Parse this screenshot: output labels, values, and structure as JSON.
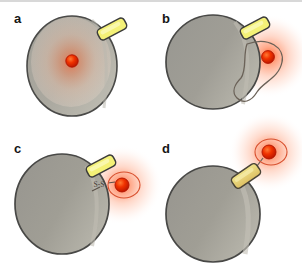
{
  "figure": {
    "kind": "scientific-schematic",
    "background_color": "#ffffff",
    "top_rule_color": "#d8d8d8",
    "panel_count": 4
  },
  "palette": {
    "cell_fill": "#9c9a92",
    "cell_fill_light": "#b4b2a9",
    "cell_outline": "#4a4a48",
    "cell_highlight": "#c9c7bd",
    "tag_fill": "#f2ef7a",
    "tag_fill_deep": "#e8c96a",
    "tag_outline": "#3c3c3a",
    "fluorophore_core": "#ee2200",
    "fluorophore_rim": "#c21a00",
    "glow_color": "#ff4d1a",
    "vesicle_outline": "#6b6258",
    "label_color": "#151515",
    "panel_a_interior": "#f0ddd2"
  },
  "panels": [
    {
      "id": "a",
      "label": "a",
      "description": "Intact cell with membrane tag and intracellular fluorophore, diffuse internal glow",
      "cell": {
        "cx": 72,
        "cy": 66,
        "rx": 45,
        "ry": 50,
        "has_interior_glow": true
      },
      "tag": {
        "cx": 112,
        "cy": 29,
        "width": 30,
        "height": 12,
        "rotation": -28,
        "attached": true
      },
      "fluorophore": {
        "cx": 72,
        "cy": 61,
        "r": 6,
        "outside_cell": false,
        "has_ring": false
      },
      "glow": {
        "cx": 72,
        "cy": 62,
        "radius": 44,
        "intensity": "low",
        "inside_cell": true
      },
      "vesicle": null,
      "linker_label": null
    },
    {
      "id": "b",
      "label": "b",
      "description": "Cell shedding a membrane vesicle that carries the fluorophore outward",
      "cell": {
        "cx": 62,
        "cy": 62,
        "rx": 47,
        "ry": 47,
        "has_interior_glow": false
      },
      "tag": {
        "cx": 104,
        "cy": 28,
        "width": 30,
        "height": 12,
        "rotation": -28,
        "attached": true
      },
      "fluorophore": {
        "cx": 117,
        "cy": 57,
        "r": 6,
        "outside_cell": true,
        "has_ring": false
      },
      "glow": {
        "cx": 118,
        "cy": 56,
        "radius": 40,
        "intensity": "high",
        "inside_cell": false
      },
      "vesicle": {
        "cx": 114,
        "cy": 62,
        "shape": "teardrop-budding",
        "outline_only": true
      },
      "linker_label": null
    },
    {
      "id": "c",
      "label": "c",
      "description": "Fluorophore released via cleavable disulfide linker, tethered outside the cell",
      "cell": {
        "cx": 62,
        "cy": 72,
        "rx": 47,
        "ry": 50,
        "has_interior_glow": false
      },
      "tag": {
        "cx": 101,
        "cy": 34,
        "width": 30,
        "height": 12,
        "rotation": -28,
        "attached": true
      },
      "fluorophore": {
        "cx": 122,
        "cy": 53,
        "r": 7,
        "outside_cell": true,
        "has_ring": true
      },
      "glow": {
        "cx": 122,
        "cy": 53,
        "radius": 38,
        "intensity": "high",
        "inside_cell": false
      },
      "vesicle": null,
      "linker_label": "S-S"
    },
    {
      "id": "d",
      "label": "d",
      "description": "Tag and fluorophore together detaching from the cell surface",
      "cell": {
        "cx": 62,
        "cy": 80,
        "rx": 47,
        "ry": 48,
        "has_interior_glow": false
      },
      "tag": {
        "cx": 97,
        "cy": 42,
        "width": 30,
        "height": 13,
        "rotation": -34,
        "attached": false
      },
      "fluorophore": {
        "cx": 118,
        "cy": 20,
        "r": 7,
        "outside_cell": true,
        "has_ring": true
      },
      "glow": {
        "cx": 118,
        "cy": 20,
        "radius": 38,
        "intensity": "high",
        "inside_cell": false
      },
      "vesicle": null,
      "linker_label": null
    }
  ],
  "legend_keys": {
    "cell_name": "cell-body",
    "tag_name": "membrane-tag",
    "fluorophore_name": "fluorophore-dot",
    "glow_name": "fluorescence-glow",
    "vesicle_name": "shed-vesicle",
    "linker_name": "disulfide-linker"
  }
}
